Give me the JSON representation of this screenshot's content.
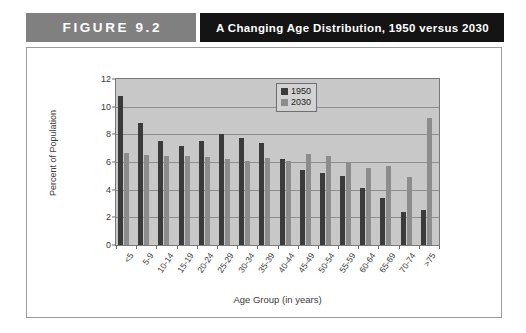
{
  "header": {
    "figure_tag": "FIGURE 9.2",
    "title": "A Changing Age Distribution, 1950 versus 2030",
    "tag_bg": "#808080",
    "title_bg": "#141414"
  },
  "chart_data": {
    "type": "bar",
    "title": "A Changing Age Distribution, 1950 versus 2030",
    "xlabel": "Age Group (in years)",
    "ylabel": "Percent of Population",
    "ylim": [
      0,
      12
    ],
    "yticks": [
      0,
      2,
      4,
      6,
      8,
      10,
      12
    ],
    "grid": true,
    "legend_position": "top-right",
    "categories": [
      "<5",
      "5-9",
      "10-14",
      "15-19",
      "20-24",
      "25-29",
      "30-34",
      "35-39",
      "40-44",
      "45-49",
      "50-54",
      "55-59",
      "60-64",
      "65-69",
      "70-74",
      ">75"
    ],
    "series": [
      {
        "name": "1950",
        "color": "#3b3b3b",
        "values": [
          10.8,
          8.8,
          7.55,
          7.15,
          7.5,
          8.0,
          7.7,
          7.4,
          6.2,
          5.4,
          5.2,
          5.0,
          4.1,
          3.4,
          2.4,
          2.5
        ]
      },
      {
        "name": "2030",
        "color": "#8c8c8c",
        "values": [
          6.65,
          6.5,
          6.45,
          6.45,
          6.35,
          6.25,
          6.05,
          6.3,
          6.05,
          6.6,
          6.4,
          6.0,
          5.6,
          5.7,
          4.9,
          9.2
        ]
      }
    ]
  }
}
